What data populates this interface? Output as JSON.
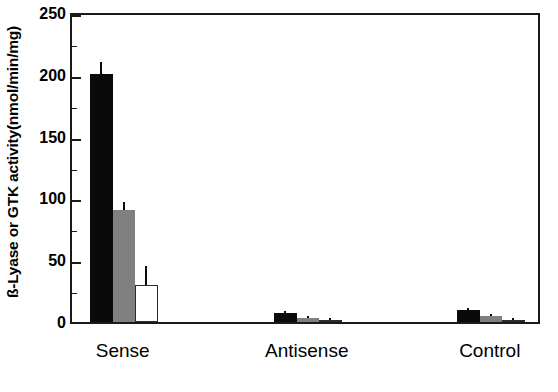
{
  "chart_data": {
    "type": "bar",
    "title": "",
    "subtitle": "",
    "xlabel": "",
    "ylabel": "ß-Lyase or GTK activity(nmol/min/mg)",
    "categories": [
      "Sense",
      "Antisense",
      "Control"
    ],
    "ylim": [
      0,
      250
    ],
    "yticks": [
      0,
      50,
      100,
      150,
      200,
      250
    ],
    "ytick_labels": [
      "0",
      "50",
      "100",
      "150",
      "200",
      "250"
    ],
    "yminor_ticks": [
      25,
      75,
      125,
      175,
      225
    ],
    "grid": false,
    "legend": "none",
    "legend_position": "none",
    "series": [
      {
        "name": "series-black",
        "color": "#0a0a0a",
        "values": [
          201,
          7,
          10
        ],
        "errors": [
          9,
          1.5,
          1.5
        ]
      },
      {
        "name": "series-gray",
        "color": "#808080",
        "values": [
          91,
          3,
          5
        ],
        "errors": [
          6,
          1.5,
          1.5
        ]
      },
      {
        "name": "series-white",
        "color": "#ffffff",
        "values": [
          30,
          1.5,
          2
        ],
        "errors": [
          15,
          1,
          1
        ]
      }
    ]
  },
  "axis": {
    "ytick_0": "0",
    "ytick_1": "50",
    "ytick_2": "100",
    "ytick_3": "150",
    "ytick_4": "200",
    "ytick_5": "250",
    "ylabel_text": "ß-Lyase or GTK activity(nmol/min/mg)",
    "xtick_0": "Sense",
    "xtick_1": "Antisense",
    "xtick_2": "Control"
  }
}
